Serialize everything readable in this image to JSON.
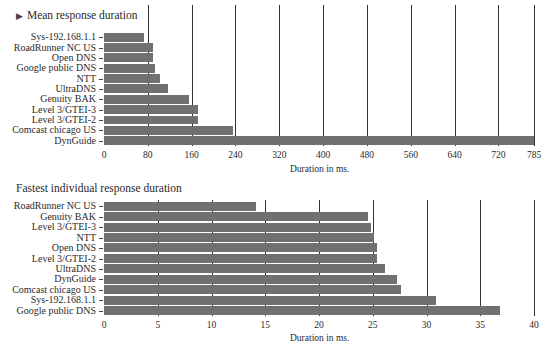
{
  "chart_data": [
    {
      "type": "bar",
      "orientation": "horizontal",
      "title": "Mean response duration",
      "title_marker": "▶",
      "xlabel": "Duration in ms.",
      "ylabel": "",
      "xlim": [
        0,
        785
      ],
      "xticks": [
        0,
        80,
        160,
        240,
        320,
        400,
        480,
        560,
        640,
        720,
        785
      ],
      "grid": true,
      "categories": [
        "Sys-192.168.1.1",
        "RoadRunner NC US",
        "Open DNS",
        "Google public DNS",
        "NTT",
        "UltraDNS",
        "Genuity BAK",
        "Level 3/GTEI-3",
        "Level 3/GTEI-2",
        "Comcast chicago US",
        "DynGuide"
      ],
      "values": [
        73,
        90,
        89,
        93,
        102,
        117,
        155,
        172,
        172,
        236,
        785
      ],
      "bar_color": "#707070"
    },
    {
      "type": "bar",
      "orientation": "horizontal",
      "title": "Fastest individual response duration",
      "xlabel": "Duration in ms.",
      "ylabel": "",
      "xlim": [
        0,
        40
      ],
      "xticks": [
        0,
        5,
        10,
        15,
        20,
        25,
        30,
        35,
        40
      ],
      "grid": true,
      "categories": [
        "RoadRunner NC US",
        "Genuity BAK",
        "Level 3/GTEI-3",
        "NTT",
        "Open DNS",
        "Level 3/GTEI-2",
        "UltraDNS",
        "DynGuide",
        "Comcast chicago US",
        "Sys-192.168.1.1",
        "Google public DNS"
      ],
      "values": [
        14.1,
        24.6,
        24.8,
        25.1,
        25.4,
        25.4,
        26.1,
        27.3,
        27.6,
        30.9,
        36.8
      ],
      "bar_color": "#707070"
    }
  ]
}
